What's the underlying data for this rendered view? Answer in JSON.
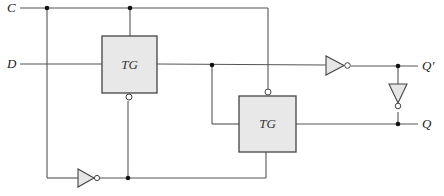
{
  "diagram": {
    "type": "transmission-gate D flip-flop / latch circuit",
    "inputs": [
      {
        "id": "C",
        "label": "C"
      },
      {
        "id": "D",
        "label": "D"
      }
    ],
    "outputs": [
      {
        "id": "Qprime",
        "label": "Q'"
      },
      {
        "id": "Q",
        "label": "Q"
      }
    ],
    "blocks": [
      {
        "id": "tg1",
        "label": "TG"
      },
      {
        "id": "tg2",
        "label": "TG"
      }
    ],
    "inverters": [
      {
        "id": "inv_clock",
        "description": "inverter producing complement of C"
      },
      {
        "id": "inv_forward",
        "description": "inverter driving Q'"
      },
      {
        "id": "inv_feedback",
        "description": "inverter from Q' to Q"
      }
    ],
    "colors": {
      "wire": "#555555",
      "block_fill": "#e8e8e8",
      "junction": "#111111"
    }
  }
}
